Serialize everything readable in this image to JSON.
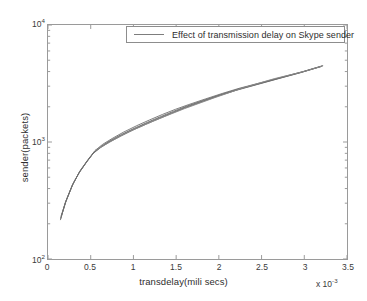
{
  "chart_data": {
    "type": "line",
    "title": "",
    "xlabel": "transdelay(mili secs)",
    "ylabel": "sender(packets)",
    "x_multiplier": "x 10",
    "x_multiplier_exp": "-3",
    "xlim": [
      0,
      3.5
    ],
    "ylim": [
      100,
      10000
    ],
    "yscale": "log",
    "xscale": "linear",
    "grid": false,
    "xticks": [
      "0",
      "0.5",
      "1",
      "1.5",
      "2",
      "2.5",
      "3",
      "3.5"
    ],
    "xtick_values": [
      0,
      0.5,
      1,
      1.5,
      2,
      2.5,
      3,
      3.5
    ],
    "yticks": [
      {
        "mantissa": "10",
        "exponent": "4",
        "value": 10000
      },
      {
        "mantissa": "10",
        "exponent": "3",
        "value": 1000
      },
      {
        "mantissa": "10",
        "exponent": "2",
        "value": 100
      }
    ],
    "legend": {
      "position": "top-center",
      "entries": [
        {
          "label": "Effect of transmission delay on Skype sender",
          "color": "#7d7d7d"
        }
      ]
    },
    "series": [
      {
        "name": "run-1",
        "color": "#6e6e6e",
        "points": [
          [
            0.145,
            215
          ],
          [
            0.2,
            300
          ],
          [
            0.28,
            420
          ],
          [
            0.36,
            540
          ],
          [
            0.45,
            670
          ],
          [
            0.53,
            800
          ],
          [
            0.62,
            900
          ],
          [
            0.72,
            1000
          ],
          [
            0.85,
            1120
          ],
          [
            1.0,
            1270
          ],
          [
            1.15,
            1420
          ],
          [
            1.3,
            1580
          ],
          [
            1.45,
            1760
          ],
          [
            1.6,
            1950
          ],
          [
            1.8,
            2200
          ],
          [
            2.0,
            2480
          ],
          [
            2.2,
            2760
          ],
          [
            2.45,
            3100
          ],
          [
            2.7,
            3480
          ],
          [
            2.95,
            3900
          ],
          [
            3.2,
            4420
          ]
        ]
      },
      {
        "name": "run-2",
        "color": "#6e6e6e",
        "points": [
          [
            0.15,
            225
          ],
          [
            0.21,
            310
          ],
          [
            0.29,
            435
          ],
          [
            0.37,
            555
          ],
          [
            0.46,
            690
          ],
          [
            0.54,
            820
          ],
          [
            0.63,
            925
          ],
          [
            0.73,
            1030
          ],
          [
            0.86,
            1160
          ],
          [
            1.02,
            1320
          ],
          [
            1.17,
            1480
          ],
          [
            1.32,
            1650
          ],
          [
            1.47,
            1830
          ],
          [
            1.62,
            2020
          ],
          [
            1.82,
            2270
          ],
          [
            2.02,
            2540
          ],
          [
            2.22,
            2820
          ],
          [
            2.47,
            3160
          ],
          [
            2.72,
            3540
          ],
          [
            2.97,
            3960
          ],
          [
            3.21,
            4460
          ]
        ]
      },
      {
        "name": "run-3",
        "color": "#6e6e6e",
        "points": [
          [
            0.152,
            232
          ],
          [
            0.215,
            320
          ],
          [
            0.3,
            450
          ],
          [
            0.38,
            575
          ],
          [
            0.47,
            710
          ],
          [
            0.55,
            845
          ],
          [
            0.64,
            955
          ],
          [
            0.75,
            1070
          ],
          [
            0.88,
            1210
          ],
          [
            1.04,
            1380
          ],
          [
            1.19,
            1545
          ],
          [
            1.34,
            1720
          ],
          [
            1.49,
            1900
          ],
          [
            1.64,
            2080
          ],
          [
            1.84,
            2330
          ],
          [
            2.04,
            2600
          ],
          [
            2.24,
            2880
          ],
          [
            2.49,
            3210
          ],
          [
            2.74,
            3590
          ],
          [
            2.99,
            4010
          ],
          [
            3.22,
            4500
          ]
        ]
      },
      {
        "name": "run-4",
        "color": "#6e6e6e",
        "points": [
          [
            0.148,
            220
          ],
          [
            0.205,
            305
          ],
          [
            0.285,
            428
          ],
          [
            0.365,
            548
          ],
          [
            0.455,
            680
          ],
          [
            0.535,
            810
          ],
          [
            0.625,
            912
          ],
          [
            0.725,
            1015
          ],
          [
            0.855,
            1140
          ],
          [
            1.01,
            1295
          ],
          [
            1.16,
            1450
          ],
          [
            1.31,
            1615
          ],
          [
            1.46,
            1790
          ],
          [
            1.61,
            1985
          ],
          [
            1.81,
            2235
          ],
          [
            2.01,
            2510
          ],
          [
            2.21,
            2790
          ],
          [
            2.46,
            3130
          ],
          [
            2.71,
            3510
          ],
          [
            2.96,
            3930
          ],
          [
            3.205,
            4440
          ]
        ]
      },
      {
        "name": "run-5-straight-chord",
        "color": "#8a8a8a",
        "points": [
          [
            0.55,
            845
          ],
          [
            0.9,
            1180
          ],
          [
            1.25,
            1530
          ],
          [
            1.6,
            1930
          ],
          [
            1.95,
            2390
          ],
          [
            2.3,
            2930
          ],
          [
            2.65,
            3480
          ],
          [
            3.0,
            4010
          ],
          [
            3.22,
            4480
          ]
        ]
      }
    ]
  },
  "legend": {
    "text": "Effect of transmission delay on Skype sender"
  },
  "axes": {
    "x_title": "transdelay(mili secs)",
    "y_title": "sender(packets)",
    "x_multiplier_base": "x 10",
    "x_multiplier_exp": "-3"
  }
}
